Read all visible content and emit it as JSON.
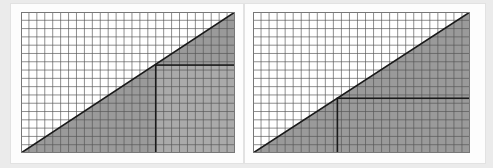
{
  "figure": {
    "background_color": "#ebebeb",
    "panel_background": "#fdfdfd",
    "panel_count": 2
  },
  "chart_data": [
    {
      "type": "area",
      "title": "",
      "subtitle": "",
      "xlabel": "",
      "ylabel": "",
      "panel_label": "left",
      "grid": true,
      "grid_color": "#555555",
      "grid_cell_size": 8,
      "grid_columns": 27,
      "grid_rows": 17,
      "xlim": [
        0,
        27
      ],
      "ylim": [
        0,
        17
      ],
      "legend": "none",
      "shapes": [
        {
          "name": "triangle-region",
          "kind": "polygon",
          "fill": "#9a9a9a",
          "stroke": "#1a1a1a",
          "stroke_width": 1.6,
          "points": [
            [
              0,
              0
            ],
            [
              27,
              0
            ],
            [
              27,
              17
            ]
          ],
          "note": "right triangle, right angle at top-right apex, hypotenuse from bottom-left to top-right"
        },
        {
          "name": "inner-rectangle",
          "kind": "rect",
          "fill": "#aaaaaa",
          "stroke": "#1a1a1a",
          "stroke_width": 1.6,
          "x": 17,
          "y": 0,
          "width": 10,
          "height": 10.6,
          "note": "lighter inscribed rectangle touching hypotenuse at its top-left corner"
        }
      ],
      "series": [
        {
          "name": "hypotenuse",
          "x": [
            0,
            27
          ],
          "values": [
            0,
            17
          ]
        }
      ],
      "annotations": []
    },
    {
      "type": "area",
      "title": "",
      "subtitle": "",
      "xlabel": "",
      "ylabel": "",
      "panel_label": "right",
      "grid": true,
      "grid_color": "#555555",
      "grid_cell_size": 8,
      "grid_columns": 27,
      "grid_rows": 17,
      "xlim": [
        0,
        27
      ],
      "ylim": [
        0,
        17
      ],
      "legend": "none",
      "shapes": [
        {
          "name": "triangle-region",
          "kind": "polygon",
          "fill": "#9a9a9a",
          "stroke": "#1a1a1a",
          "stroke_width": 1.6,
          "points": [
            [
              0,
              0
            ],
            [
              27,
              0
            ],
            [
              27,
              17
            ]
          ],
          "note": "right triangle, right angle at top-right apex, hypotenuse from bottom-left to top-right"
        },
        {
          "name": "inner-rectangle",
          "kind": "rect",
          "fill": "#9a9a9a",
          "stroke": "#1a1a1a",
          "stroke_width": 1.6,
          "x": 10.5,
          "y": 0,
          "width": 16.5,
          "height": 6.6,
          "note": "inscribed rectangle, same fill as triangle, top-left corner on hypotenuse"
        }
      ],
      "series": [
        {
          "name": "hypotenuse",
          "x": [
            0,
            27
          ],
          "values": [
            0,
            17
          ]
        }
      ],
      "annotations": []
    }
  ]
}
